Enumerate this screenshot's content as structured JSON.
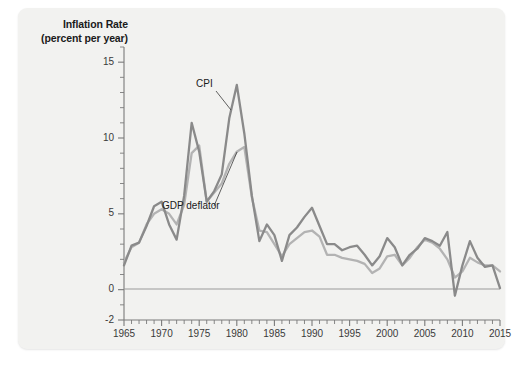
{
  "figure": {
    "axis_title_line1": "Inflation Rate",
    "axis_title_line2": "(percent per year)",
    "panel_bg": "#f2f2f0",
    "page_bg": "#ffffff"
  },
  "annotations": {
    "cpi_label": "CPI",
    "deflator_label": "GDP deflator"
  },
  "chart_data": {
    "type": "line",
    "title": "Inflation Rate (percent per year)",
    "xlabel": "",
    "ylabel": "Inflation Rate (percent per year)",
    "xlim": [
      1965,
      2015
    ],
    "ylim": [
      -2,
      16
    ],
    "yticks": [
      -2,
      0,
      5,
      10,
      15
    ],
    "ytick_labels": [
      "-2",
      "0",
      "5",
      "10",
      "15"
    ],
    "y_minor_tick_step": 1,
    "xticks": [
      1965,
      1970,
      1975,
      1980,
      1985,
      1990,
      1995,
      2000,
      2005,
      2010,
      2015
    ],
    "xtick_labels": [
      "1965",
      "1970",
      "1975",
      "1980",
      "1985",
      "1990",
      "1995",
      "2000",
      "2005",
      "2010",
      "2015"
    ],
    "x_minor_tick_step": 1,
    "grid": false,
    "legend": "inline-annotations",
    "zero_line": true,
    "colors": {
      "cpi": "#8a8a8a",
      "gdp_deflator": "#b3b3b3",
      "axis": "#7a7a7a",
      "zero_line": "#9a9a9a"
    },
    "x": [
      1965,
      1966,
      1967,
      1968,
      1969,
      1970,
      1971,
      1972,
      1973,
      1974,
      1975,
      1976,
      1977,
      1978,
      1979,
      1980,
      1981,
      1982,
      1983,
      1984,
      1985,
      1986,
      1987,
      1988,
      1989,
      1990,
      1991,
      1992,
      1993,
      1994,
      1995,
      1996,
      1997,
      1998,
      1999,
      2000,
      2001,
      2002,
      2003,
      2004,
      2005,
      2006,
      2007,
      2008,
      2009,
      2010,
      2011,
      2012,
      2013,
      2014,
      2015
    ],
    "series": [
      {
        "name": "CPI",
        "color": "#8a8a8a",
        "values": [
          1.6,
          2.9,
          3.1,
          4.2,
          5.5,
          5.8,
          4.3,
          3.3,
          6.2,
          11.0,
          9.1,
          5.8,
          6.5,
          7.6,
          11.3,
          13.5,
          10.3,
          6.2,
          3.2,
          4.3,
          3.6,
          1.9,
          3.6,
          4.1,
          4.8,
          5.4,
          4.2,
          3.0,
          3.0,
          2.6,
          2.8,
          2.9,
          2.3,
          1.6,
          2.2,
          3.4,
          2.8,
          1.6,
          2.3,
          2.7,
          3.4,
          3.2,
          2.9,
          3.8,
          -0.4,
          1.6,
          3.2,
          2.1,
          1.5,
          1.6,
          0.1
        ]
      },
      {
        "name": "GDP deflator",
        "color": "#b3b3b3",
        "values": [
          1.8,
          2.8,
          3.1,
          4.3,
          5.0,
          5.3,
          5.0,
          4.3,
          5.6,
          9.0,
          9.5,
          5.8,
          6.4,
          7.0,
          8.3,
          9.1,
          9.4,
          6.1,
          3.9,
          3.8,
          3.0,
          2.2,
          3.0,
          3.4,
          3.8,
          3.9,
          3.5,
          2.3,
          2.3,
          2.1,
          2.0,
          1.9,
          1.7,
          1.1,
          1.4,
          2.2,
          2.3,
          1.6,
          2.1,
          2.8,
          3.3,
          3.1,
          2.7,
          2.0,
          0.8,
          1.2,
          2.1,
          1.8,
          1.6,
          1.6,
          1.2
        ]
      }
    ]
  }
}
